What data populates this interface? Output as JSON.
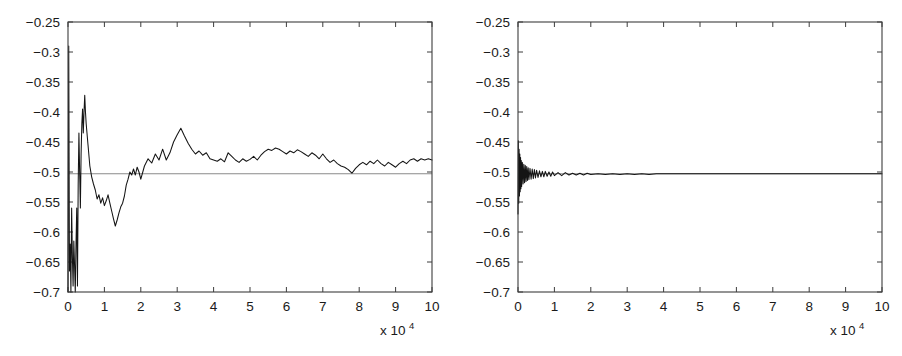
{
  "figure": {
    "background_color": "#ffffff",
    "panel_count": 2
  },
  "axis_style": {
    "box_color": "#3d3d3d",
    "data_line_color": "#141414",
    "reference_line_color": "#8a8a8a",
    "tick_direction": "in",
    "tick_sides": "all-four"
  },
  "chart_data": [
    {
      "type": "line",
      "panel": "left",
      "title": "",
      "xlabel": "",
      "ylabel": "",
      "x_multiplier_label": "x 10",
      "x_multiplier_exponent": "4",
      "xlim": [
        0,
        10
      ],
      "ylim": [
        -0.7,
        -0.25
      ],
      "grid": false,
      "legend": "none",
      "xticks": [
        "0",
        "1",
        "2",
        "3",
        "4",
        "5",
        "6",
        "7",
        "8",
        "9",
        "10"
      ],
      "xtick_values": [
        0,
        1,
        2,
        3,
        4,
        5,
        6,
        7,
        8,
        9,
        10
      ],
      "yticks": [
        "-0.25",
        "-0.3",
        "-0.35",
        "-0.4",
        "-0.45",
        "-0.5",
        "-0.55",
        "-0.6",
        "-0.65",
        "-0.7"
      ],
      "ytick_values": [
        -0.25,
        -0.3,
        -0.35,
        -0.4,
        -0.45,
        -0.5,
        -0.55,
        -0.6,
        -0.65,
        -0.7
      ],
      "series": [
        {
          "name": "reference",
          "kind": "horizontal-line",
          "value": -0.503,
          "color": "#8a8a8a"
        },
        {
          "name": "estimate",
          "kind": "trace",
          "color": "#141414",
          "x": [
            0.0,
            0.02,
            0.04,
            0.06,
            0.08,
            0.1,
            0.12,
            0.14,
            0.16,
            0.18,
            0.2,
            0.22,
            0.24,
            0.26,
            0.28,
            0.3,
            0.32,
            0.34,
            0.36,
            0.38,
            0.4,
            0.42,
            0.44,
            0.46,
            0.48,
            0.5,
            0.55,
            0.6,
            0.65,
            0.7,
            0.75,
            0.8,
            0.85,
            0.9,
            0.95,
            1.0,
            1.05,
            1.1,
            1.15,
            1.2,
            1.25,
            1.3,
            1.35,
            1.4,
            1.45,
            1.5,
            1.55,
            1.6,
            1.65,
            1.7,
            1.75,
            1.8,
            1.85,
            1.9,
            1.95,
            2.0,
            2.1,
            2.2,
            2.3,
            2.4,
            2.5,
            2.6,
            2.7,
            2.8,
            2.9,
            3.0,
            3.1,
            3.2,
            3.3,
            3.4,
            3.5,
            3.6,
            3.7,
            3.8,
            3.9,
            4.0,
            4.1,
            4.2,
            4.3,
            4.4,
            4.5,
            4.6,
            4.7,
            4.8,
            4.9,
            5.0,
            5.1,
            5.2,
            5.3,
            5.4,
            5.5,
            5.6,
            5.7,
            5.8,
            5.9,
            6.0,
            6.1,
            6.2,
            6.3,
            6.4,
            6.5,
            6.6,
            6.7,
            6.8,
            6.9,
            7.0,
            7.1,
            7.2,
            7.3,
            7.4,
            7.5,
            7.6,
            7.7,
            7.8,
            7.9,
            8.0,
            8.1,
            8.2,
            8.3,
            8.4,
            8.5,
            8.6,
            8.7,
            8.8,
            8.9,
            9.0,
            9.1,
            9.2,
            9.3,
            9.4,
            9.5,
            9.6,
            9.7,
            9.8,
            9.9,
            10.0
          ],
          "y": [
            -0.7,
            -0.29,
            -0.665,
            -0.62,
            -0.7,
            -0.56,
            -0.64,
            -0.69,
            -0.615,
            -0.655,
            -0.7,
            -0.62,
            -0.56,
            -0.69,
            -0.52,
            -0.435,
            -0.5,
            -0.56,
            -0.47,
            -0.42,
            -0.395,
            -0.435,
            -0.4,
            -0.372,
            -0.4,
            -0.42,
            -0.455,
            -0.49,
            -0.508,
            -0.52,
            -0.53,
            -0.545,
            -0.538,
            -0.552,
            -0.543,
            -0.556,
            -0.548,
            -0.538,
            -0.552,
            -0.565,
            -0.578,
            -0.59,
            -0.58,
            -0.568,
            -0.558,
            -0.552,
            -0.54,
            -0.522,
            -0.512,
            -0.5,
            -0.505,
            -0.495,
            -0.505,
            -0.492,
            -0.5,
            -0.512,
            -0.49,
            -0.478,
            -0.485,
            -0.47,
            -0.48,
            -0.462,
            -0.48,
            -0.468,
            -0.45,
            -0.438,
            -0.427,
            -0.44,
            -0.452,
            -0.462,
            -0.47,
            -0.465,
            -0.472,
            -0.468,
            -0.478,
            -0.48,
            -0.482,
            -0.478,
            -0.483,
            -0.468,
            -0.474,
            -0.48,
            -0.484,
            -0.478,
            -0.482,
            -0.479,
            -0.474,
            -0.48,
            -0.472,
            -0.466,
            -0.462,
            -0.464,
            -0.46,
            -0.462,
            -0.466,
            -0.47,
            -0.465,
            -0.468,
            -0.463,
            -0.466,
            -0.47,
            -0.474,
            -0.468,
            -0.472,
            -0.478,
            -0.47,
            -0.478,
            -0.484,
            -0.48,
            -0.486,
            -0.49,
            -0.492,
            -0.496,
            -0.502,
            -0.494,
            -0.488,
            -0.484,
            -0.488,
            -0.482,
            -0.486,
            -0.48,
            -0.486,
            -0.49,
            -0.484,
            -0.488,
            -0.492,
            -0.486,
            -0.482,
            -0.486,
            -0.48,
            -0.478,
            -0.482,
            -0.478,
            -0.48,
            -0.478,
            -0.48
          ]
        }
      ]
    },
    {
      "type": "line",
      "panel": "right",
      "title": "",
      "xlabel": "",
      "ylabel": "",
      "x_multiplier_label": "x 10",
      "x_multiplier_exponent": "4",
      "xlim": [
        0,
        10
      ],
      "ylim": [
        -0.7,
        -0.25
      ],
      "grid": false,
      "legend": "none",
      "xticks": [
        "0",
        "1",
        "2",
        "3",
        "4",
        "5",
        "6",
        "7",
        "8",
        "9",
        "10"
      ],
      "xtick_values": [
        0,
        1,
        2,
        3,
        4,
        5,
        6,
        7,
        8,
        9,
        10
      ],
      "yticks": [
        "-0.25",
        "-0.3",
        "-0.35",
        "-0.4",
        "-0.45",
        "-0.5",
        "-0.55",
        "-0.6",
        "-0.65",
        "-0.7"
      ],
      "ytick_values": [
        -0.25,
        -0.3,
        -0.35,
        -0.4,
        -0.45,
        -0.5,
        -0.55,
        -0.6,
        -0.65,
        -0.7
      ],
      "series": [
        {
          "name": "reference",
          "kind": "horizontal-line",
          "value": -0.503,
          "color": "#8a8a8a"
        },
        {
          "name": "estimate",
          "kind": "trace",
          "color": "#141414",
          "x": [
            0.0,
            0.01,
            0.02,
            0.03,
            0.04,
            0.05,
            0.06,
            0.07,
            0.08,
            0.09,
            0.1,
            0.12,
            0.14,
            0.16,
            0.18,
            0.2,
            0.22,
            0.24,
            0.26,
            0.28,
            0.3,
            0.33,
            0.36,
            0.39,
            0.42,
            0.45,
            0.48,
            0.51,
            0.55,
            0.59,
            0.63,
            0.67,
            0.71,
            0.75,
            0.8,
            0.85,
            0.9,
            0.95,
            1.0,
            1.1,
            1.2,
            1.3,
            1.4,
            1.5,
            1.6,
            1.7,
            1.8,
            1.9,
            2.0,
            2.2,
            2.4,
            2.6,
            2.8,
            3.0,
            3.2,
            3.4,
            3.6,
            3.8,
            4.0,
            4.5,
            5.0,
            5.5,
            6.0,
            6.5,
            7.0,
            7.5,
            8.0,
            8.5,
            9.0,
            9.5,
            10.0
          ],
          "y": [
            -0.57,
            -0.448,
            -0.552,
            -0.462,
            -0.54,
            -0.47,
            -0.533,
            -0.476,
            -0.528,
            -0.481,
            -0.524,
            -0.484,
            -0.52,
            -0.487,
            -0.518,
            -0.489,
            -0.516,
            -0.491,
            -0.514,
            -0.493,
            -0.513,
            -0.494,
            -0.512,
            -0.495,
            -0.511,
            -0.496,
            -0.51,
            -0.497,
            -0.509,
            -0.498,
            -0.508,
            -0.499,
            -0.508,
            -0.499,
            -0.507,
            -0.5,
            -0.507,
            -0.5,
            -0.506,
            -0.501,
            -0.506,
            -0.501,
            -0.505,
            -0.502,
            -0.505,
            -0.502,
            -0.505,
            -0.502,
            -0.504,
            -0.503,
            -0.504,
            -0.503,
            -0.504,
            -0.503,
            -0.504,
            -0.503,
            -0.504,
            -0.503,
            -0.503,
            -0.503,
            -0.503,
            -0.503,
            -0.503,
            -0.503,
            -0.503,
            -0.503,
            -0.503,
            -0.503,
            -0.503,
            -0.503,
            -0.503
          ]
        }
      ]
    }
  ]
}
